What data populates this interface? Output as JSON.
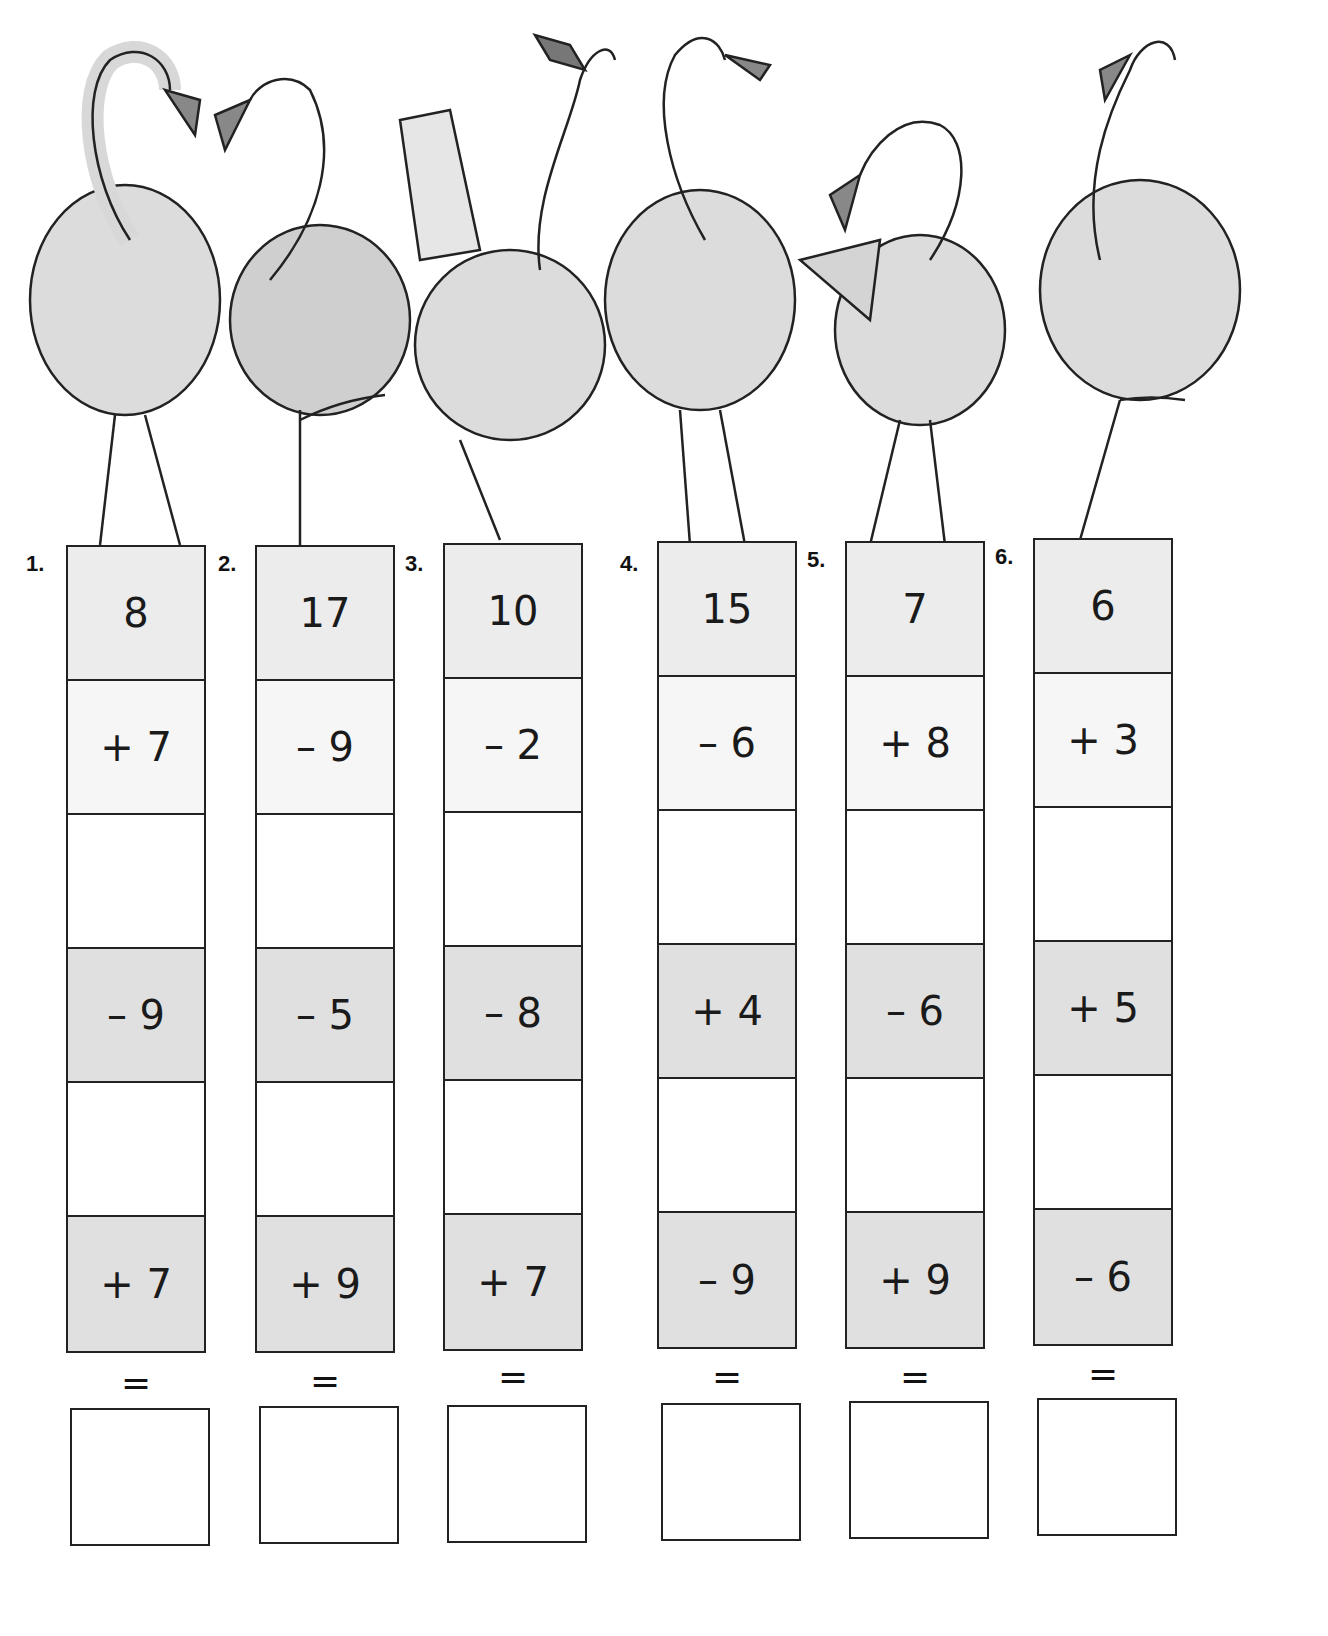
{
  "worksheet": {
    "columns": [
      {
        "number": "1.",
        "start": "8",
        "ops": [
          "+ 7",
          "",
          "– 9",
          "",
          "+ 7"
        ],
        "equals": "=",
        "answer": ""
      },
      {
        "number": "2.",
        "start": "17",
        "ops": [
          "– 9",
          "",
          "– 5",
          "",
          "+ 9"
        ],
        "equals": "=",
        "answer": ""
      },
      {
        "number": "3.",
        "start": "10",
        "ops": [
          "– 2",
          "",
          "– 8",
          "",
          "+ 7"
        ],
        "equals": "=",
        "answer": ""
      },
      {
        "number": "4.",
        "start": "15",
        "ops": [
          "– 6",
          "",
          "+ 4",
          "",
          "– 9"
        ],
        "equals": "=",
        "answer": ""
      },
      {
        "number": "5.",
        "start": "7",
        "ops": [
          "+ 8",
          "",
          "– 6",
          "",
          "+ 9"
        ],
        "equals": "=",
        "answer": ""
      },
      {
        "number": "6.",
        "start": "6",
        "ops": [
          "+ 3",
          "",
          "+ 5",
          "",
          "– 6"
        ],
        "equals": "=",
        "answer": ""
      }
    ]
  },
  "illustration": {
    "subject": "six cartoon flamingos standing on top of the number columns",
    "icons": [
      "flamingo-icon"
    ]
  },
  "colors": {
    "start_cell": "#ececec",
    "light_op_cell": "#f6f6f6",
    "dark_op_cell": "#e0e0e0",
    "line": "#222222"
  }
}
